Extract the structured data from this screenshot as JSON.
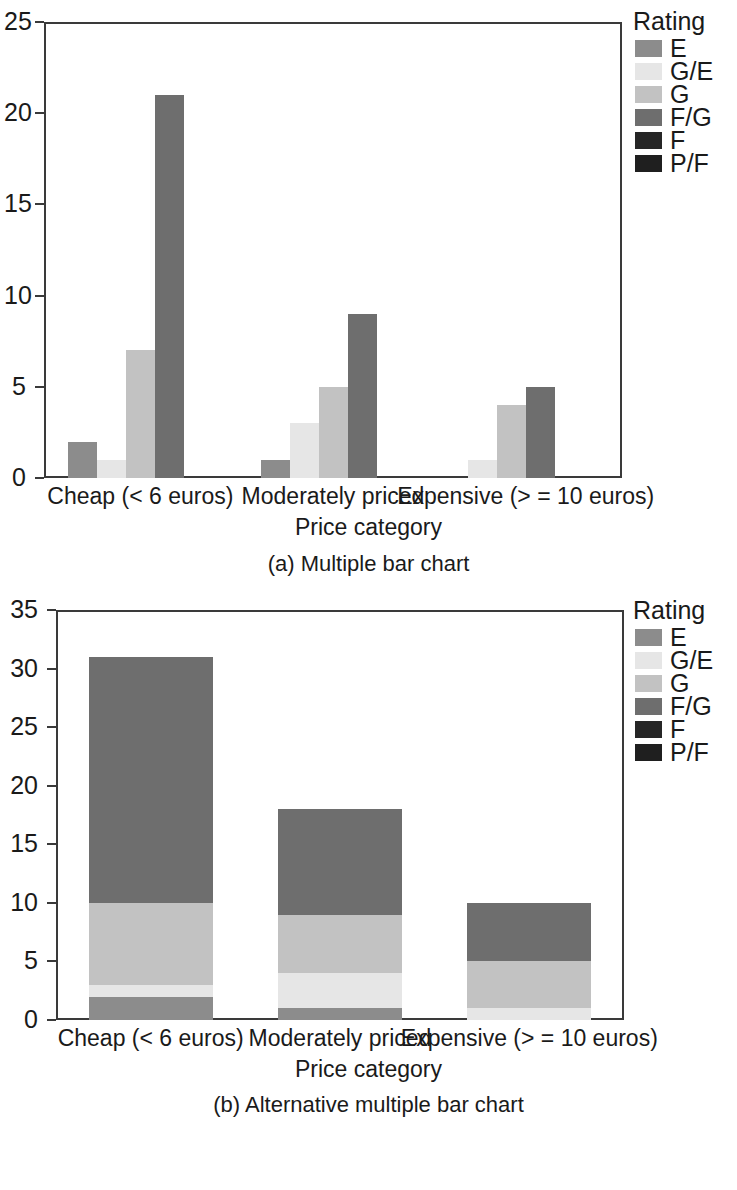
{
  "figure_a": {
    "caption": "(a) Multiple bar chart",
    "legend_title": "Rating",
    "xlabel": "Price category",
    "yticks": [
      "0",
      "5",
      "10",
      "15",
      "20",
      "25"
    ],
    "categories": [
      "Cheap (< 6 euros)",
      "Moderately priced",
      "Expensive (> = 10 euros)"
    ]
  },
  "figure_b": {
    "caption": "(b) Alternative multiple bar chart",
    "legend_title": "Rating",
    "xlabel": "Price category",
    "yticks": [
      "0",
      "5",
      "10",
      "15",
      "20",
      "25",
      "30",
      "35"
    ],
    "categories": [
      "Cheap (< 6 euros)",
      "Moderately priced",
      "Expensive (> = 10 euros)"
    ]
  },
  "legend_entries": [
    "E",
    "G/E",
    "G",
    "F/G",
    "F",
    "P/F"
  ],
  "colors": {
    "E": "#8c8c8c",
    "G/E": "#e6e6e6",
    "G": "#c2c2c2",
    "F/G": "#6e6e6e",
    "F": "#262626",
    "P/F": "#1f1f1f",
    "axis": "#3a3a3a",
    "text": "#1a1a1a",
    "background": "#ffffff"
  },
  "chart_data": [
    {
      "type": "bar",
      "title": "(a) Multiple bar chart",
      "xlabel": "Price category",
      "ylabel": "",
      "ylim": [
        0,
        25
      ],
      "yticks": [
        0,
        5,
        10,
        15,
        20,
        25
      ],
      "grid": false,
      "legend": "Rating",
      "legend_position": "right",
      "grouping": "grouped",
      "categories": [
        "Cheap (< 6 euros)",
        "Moderately priced",
        "Expensive (> = 10 euros)"
      ],
      "series": [
        {
          "name": "E",
          "values": [
            2,
            1,
            0
          ]
        },
        {
          "name": "G/E",
          "values": [
            1,
            3,
            1
          ]
        },
        {
          "name": "G",
          "values": [
            7,
            5,
            4
          ]
        },
        {
          "name": "F/G",
          "values": [
            21,
            9,
            5
          ]
        },
        {
          "name": "F",
          "values": [
            0,
            0,
            0
          ]
        },
        {
          "name": "P/F",
          "values": [
            0,
            0,
            0
          ]
        }
      ]
    },
    {
      "type": "bar",
      "title": "(b) Alternative multiple bar chart",
      "xlabel": "Price category",
      "ylabel": "",
      "ylim": [
        0,
        35
      ],
      "yticks": [
        0,
        5,
        10,
        15,
        20,
        25,
        30,
        35
      ],
      "grid": false,
      "legend": "Rating",
      "legend_position": "right",
      "grouping": "stacked",
      "categories": [
        "Cheap (< 6 euros)",
        "Moderately priced",
        "Expensive (> = 10 euros)"
      ],
      "totals": [
        31,
        18,
        10
      ],
      "series": [
        {
          "name": "E",
          "values": [
            2,
            1,
            0
          ]
        },
        {
          "name": "G/E",
          "values": [
            1,
            3,
            1
          ]
        },
        {
          "name": "G",
          "values": [
            7,
            5,
            4
          ]
        },
        {
          "name": "F/G",
          "values": [
            21,
            9,
            5
          ]
        },
        {
          "name": "F",
          "values": [
            0,
            0,
            0
          ]
        },
        {
          "name": "P/F",
          "values": [
            0,
            0,
            0
          ]
        }
      ]
    }
  ]
}
